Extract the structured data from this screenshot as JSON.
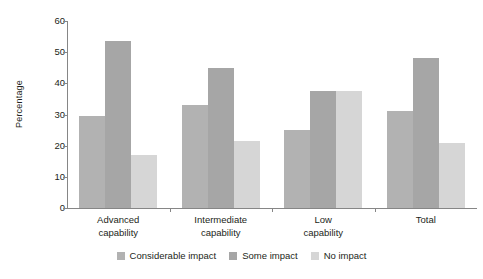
{
  "chart_data": {
    "type": "bar",
    "title": "",
    "xlabel": "",
    "ylabel": "Percentage",
    "ylim": [
      0,
      60
    ],
    "yticks": [
      0,
      10,
      20,
      30,
      40,
      50,
      60
    ],
    "grid": false,
    "legend_position": "bottom",
    "categories": [
      "Advanced\ncapability",
      "Intermediate\ncapability",
      "Low\ncapability",
      "Total"
    ],
    "category_lines": [
      [
        "Advanced",
        "capability"
      ],
      [
        "Intermediate",
        "capability"
      ],
      [
        "Low",
        "capability"
      ],
      [
        "Total",
        ""
      ]
    ],
    "series": [
      {
        "name": "Considerable impact",
        "color": "#b2b2b2",
        "values": [
          29.5,
          33.0,
          25.0,
          31.0
        ]
      },
      {
        "name": "Some impact",
        "color": "#a6a6a6",
        "values": [
          53.5,
          45.0,
          37.5,
          48.0
        ]
      },
      {
        "name": "No impact",
        "color": "#d6d6d6",
        "values": [
          17.0,
          21.5,
          37.5,
          21.0
        ]
      }
    ]
  },
  "axis": {
    "y_title": "Percentage",
    "tick_labels": [
      "60",
      "50",
      "40",
      "30",
      "20",
      "10",
      "0"
    ]
  },
  "legend": {
    "items": [
      {
        "label": "Considerable impact",
        "color": "#b2b2b2"
      },
      {
        "label": "Some impact",
        "color": "#a6a6a6"
      },
      {
        "label": "No impact",
        "color": "#d6d6d6"
      }
    ]
  },
  "colors": {
    "axis": "#868686",
    "text": "#231f20",
    "background": "#ffffff"
  }
}
